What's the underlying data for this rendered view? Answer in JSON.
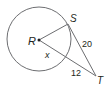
{
  "diagram": {
    "type": "geometry-tangent-secant",
    "colors": {
      "stroke": "#6d6e71",
      "text": "#231f20"
    },
    "circle": {
      "center_label": "R"
    },
    "points": {
      "R": {
        "label": "R"
      },
      "S": {
        "label": "S"
      },
      "T": {
        "label": "T"
      }
    },
    "segments": {
      "RS": {
        "label": "x"
      },
      "ST": {
        "label": "20"
      },
      "external_RT": {
        "label": "12"
      }
    }
  }
}
